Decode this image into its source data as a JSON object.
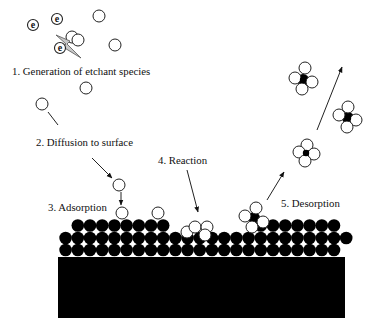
{
  "diagram": {
    "steps": [
      {
        "label": "1. Generation of etchant species"
      },
      {
        "label": "2. Diffusion to surface"
      },
      {
        "label": "3. Adsorption"
      },
      {
        "label": "4. Reaction"
      },
      {
        "label": "5. Desorption"
      }
    ],
    "electron_symbol": "e"
  },
  "colors": {
    "atom": "#000000",
    "etchant_fill": "#ffffff",
    "outline": "#222222",
    "bolt_fill": "#c8c8c8",
    "arrow": "#222222"
  },
  "scene": {
    "substrate": {
      "x": 58,
      "y": 257,
      "w": 287,
      "h": 61
    },
    "atom_radius": 6.3,
    "atom_pitch": 12.2,
    "atom_x0": 65.6,
    "atom_rows": [
      {
        "name": "surface-row-bottom",
        "y": 250,
        "segments": [
          [
            0,
            22
          ]
        ]
      },
      {
        "name": "surface-row-middle",
        "y": 238,
        "segments": [
          [
            0,
            23
          ]
        ]
      },
      {
        "name": "surface-row-top",
        "y": 225.5,
        "segments": [
          [
            1,
            8
          ],
          [
            16,
            22
          ]
        ]
      }
    ],
    "particle_radius": 6,
    "free_radicals": [
      [
        99,
        16
      ],
      [
        115,
        45
      ],
      [
        72,
        37
      ],
      [
        78,
        40
      ],
      [
        86,
        88
      ],
      [
        42,
        104
      ],
      [
        119,
        185
      ]
    ],
    "electrons": [
      [
        33,
        25
      ],
      [
        57,
        19
      ],
      [
        60,
        48
      ]
    ],
    "adsorbed_species": [
      [
        122,
        213
      ],
      [
        158,
        213
      ]
    ],
    "reaction_cluster": [
      [
        187,
        232
      ],
      [
        195,
        227
      ],
      [
        207,
        227
      ],
      [
        205,
        235
      ]
    ],
    "volatile_products": [
      {
        "center": [
          254,
          218
        ],
        "ligands": [
          [
            256,
            208
          ],
          [
            245,
            216
          ],
          [
            263,
            222
          ],
          [
            252,
            227
          ]
        ]
      },
      {
        "center": [
          303,
          80
        ],
        "ligands": [
          [
            305,
            68
          ],
          [
            295,
            78
          ],
          [
            312,
            82
          ],
          [
            302,
            89
          ]
        ]
      },
      {
        "center": [
          348,
          118
        ],
        "ligands": [
          [
            348,
            107
          ],
          [
            339,
            115
          ],
          [
            356,
            120
          ],
          [
            347,
            127
          ]
        ]
      },
      {
        "center": [
          306,
          153
        ],
        "ligands": [
          [
            307,
            145
          ],
          [
            299,
            152
          ],
          [
            314,
            154
          ],
          [
            305,
            161
          ]
        ]
      }
    ],
    "arrows": [
      {
        "name": "diffusion-trail-line",
        "from": [
          48,
          112
        ],
        "to": [
          58,
          125
        ],
        "head": false
      },
      {
        "name": "diffusion-arrow",
        "from": [
          92,
          158
        ],
        "to": [
          112,
          178
        ],
        "head": true
      },
      {
        "name": "adsorption-arrow",
        "from": [
          121,
          192
        ],
        "to": [
          121,
          205
        ],
        "head": true
      },
      {
        "name": "reaction-arrow",
        "from": [
          187,
          170
        ],
        "to": [
          198,
          212
        ],
        "head": true
      },
      {
        "name": "desorption-arrow-lower",
        "from": [
          267,
          200
        ],
        "to": [
          284,
          172
        ],
        "head": true
      },
      {
        "name": "desorption-arrow-upper",
        "from": [
          317,
          130
        ],
        "to": [
          342,
          67
        ],
        "head": true
      }
    ],
    "plasma_bolt": "M56,35 L70,41 L67,44 L81,58 L63,47 L66,44 Z"
  }
}
